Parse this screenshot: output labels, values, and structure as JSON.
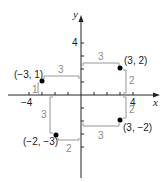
{
  "diagram": {
    "type": "coordinate-plane",
    "axes": {
      "x_label": "x",
      "y_label": "y",
      "tick_labels": {
        "x_neg": "−4",
        "x_pos": "4",
        "y_pos": "4"
      },
      "x_range": [
        -6,
        6
      ],
      "y_range": [
        -6,
        5
      ]
    },
    "points": [
      {
        "label": "(3, 2)",
        "x": 3,
        "y": 2
      },
      {
        "label": "(−3, 1)",
        "x": -3,
        "y": 1
      },
      {
        "label": "(−2, −3)",
        "x": -2,
        "y": -3
      },
      {
        "label": "(3, −2)",
        "x": 3,
        "y": -2
      }
    ],
    "distance_labels": [
      {
        "for": "(3, 2)",
        "horizontal": "3",
        "vertical": "2"
      },
      {
        "for": "(−3, 1)",
        "horizontal": "3",
        "vertical": "1"
      },
      {
        "for": "(−2, −3)",
        "horizontal": "2",
        "vertical": "3"
      },
      {
        "for": "(3, −2)",
        "horizontal": "3",
        "vertical": "2"
      }
    ],
    "colors": {
      "axis": "#222222",
      "guide": "#8a8a8a",
      "point": "#000000"
    }
  }
}
